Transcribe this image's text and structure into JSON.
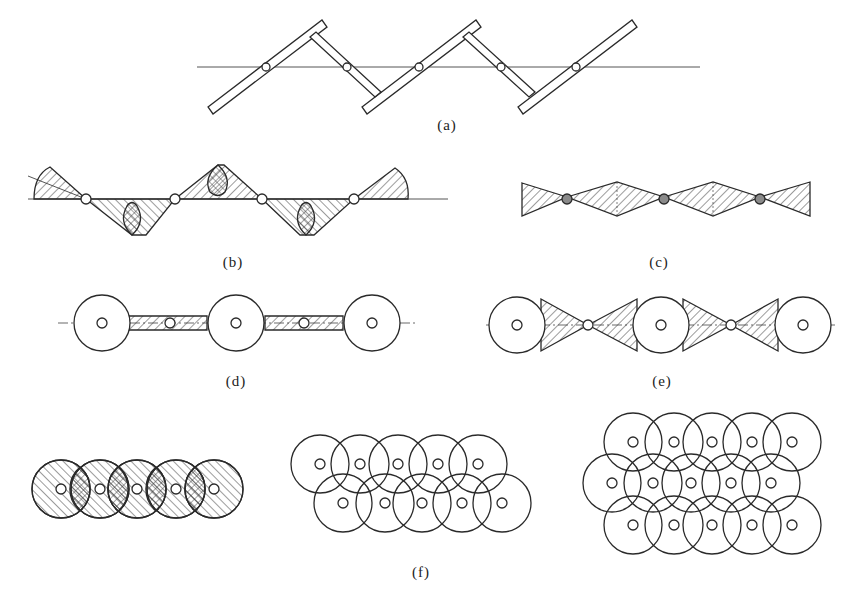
{
  "figure": {
    "panels": [
      {
        "id": "a",
        "label": "(a)",
        "description": "zigzag linkage of rectangular bars with 5 pivot points on a horizontal axis"
      },
      {
        "id": "b",
        "label": "(b)",
        "description": "hatched fan-shaped sweep regions around 4 pivot points with cross-hatched overlaps"
      },
      {
        "id": "c",
        "label": "(c)",
        "description": "chain of hatched rhombic regions joined at 3 shaded pivot nodes"
      },
      {
        "id": "d",
        "label": "(d)",
        "description": "3 large circles joined by narrow hatched bridges through 2 small nodes on a dash-dot centerline"
      },
      {
        "id": "e",
        "label": "(e)",
        "description": "3 large circles joined by hatched tangent triangles meeting at 2 small nodes on a dash-dot centerline"
      },
      {
        "id": "f",
        "label": "(f)",
        "description": "overlapping circle arrangements: single hatched row of 5, two staggered rows of 5, three staggered rows of 5"
      }
    ]
  },
  "colors": {
    "stroke": "#2a2a2a",
    "hatch": "#3a3a3a",
    "background": "#ffffff"
  }
}
